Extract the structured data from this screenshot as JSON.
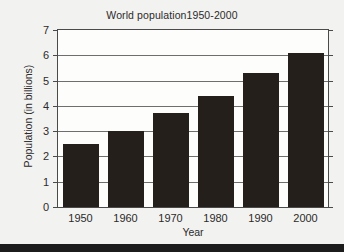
{
  "chart_data": {
    "type": "bar",
    "title": "World population1950-2000",
    "xlabel": "Year",
    "ylabel": "Population (in billions)",
    "categories": [
      "1950",
      "1960",
      "1970",
      "1980",
      "1990",
      "2000"
    ],
    "values": [
      2.5,
      3.0,
      3.7,
      4.4,
      5.3,
      6.1
    ],
    "ylim": [
      0,
      7
    ],
    "ytick_labels": [
      "0",
      "1",
      "2",
      "3",
      "4",
      "5",
      "6",
      "7"
    ],
    "ytick_values": [
      0,
      1,
      2,
      3,
      4,
      5,
      6,
      7
    ],
    "grid": true,
    "legend": false,
    "series_name": "World population",
    "bar_color": "#241f1b",
    "plot_background": "#fdfdfc",
    "figure_background": "#f2f2f0",
    "axis_color": "#4a4a4a",
    "gridline_color": "#6e6e6e"
  }
}
